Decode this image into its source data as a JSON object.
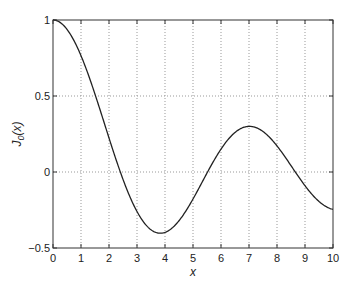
{
  "chart_data": {
    "type": "line",
    "title": "",
    "xlabel": "x",
    "ylabel": "J0(x)",
    "ylabel_main": "J",
    "ylabel_sub": "0",
    "ylabel_rest": "(x)",
    "xlim": [
      0,
      10
    ],
    "ylim": [
      -0.5,
      1
    ],
    "grid": true,
    "x_ticks": [
      "0",
      "1",
      "2",
      "3",
      "4",
      "5",
      "6",
      "7",
      "8",
      "9",
      "10"
    ],
    "y_ticks": [
      "1",
      "0.5",
      "0",
      "−0.5"
    ],
    "series": [
      {
        "name": "J0(x)",
        "function": "Bessel J0",
        "x": [
          0,
          0.5,
          1,
          1.5,
          2,
          2.405,
          2.5,
          3,
          3.5,
          3.832,
          4,
          4.5,
          5,
          5.5,
          5.52,
          6,
          6.5,
          7,
          7.016,
          7.5,
          8,
          8.5,
          8.654,
          9,
          9.5,
          10
        ],
        "values": [
          1,
          0.938,
          0.765,
          0.512,
          0.224,
          0,
          -0.048,
          -0.26,
          -0.38,
          -0.403,
          -0.397,
          -0.321,
          -0.178,
          -0.007,
          0,
          0.151,
          0.26,
          0.3,
          0.3,
          0.266,
          0.172,
          0.042,
          0,
          -0.09,
          -0.194,
          -0.246
        ]
      }
    ]
  }
}
